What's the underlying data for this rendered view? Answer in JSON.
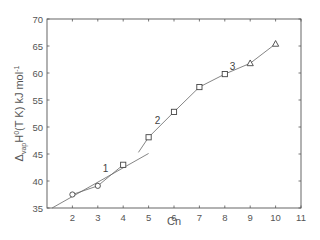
{
  "chart_data": {
    "type": "line",
    "title": "",
    "xlabel": "Cn",
    "ylabel_parts": {
      "delta": "Δ",
      "sub": "vap",
      "H": "H",
      "sup": "0",
      "rest": "(T K) kJ mol",
      "unit_sup": "-1"
    },
    "ylabel": "Δvap H0(T K) kJ mol-1",
    "xlim": [
      1,
      11
    ],
    "ylim": [
      35,
      70
    ],
    "xticks": [
      2,
      3,
      4,
      5,
      6,
      7,
      8,
      9,
      10,
      11
    ],
    "yticks": [
      35,
      40,
      45,
      50,
      55,
      60,
      65,
      70
    ],
    "grid": false,
    "legend": null,
    "series": [
      {
        "name": "group 1",
        "marker": "circle",
        "x": [
          2,
          3
        ],
        "y": [
          37.5,
          39.1
        ]
      },
      {
        "name": "group 2",
        "marker": "square",
        "x": [
          4,
          5,
          6,
          7,
          8
        ],
        "y": [
          43.0,
          48.1,
          52.8,
          57.4,
          59.8
        ]
      },
      {
        "name": "group 3",
        "marker": "triangle",
        "x": [
          9,
          10
        ],
        "y": [
          61.8,
          65.4
        ]
      }
    ],
    "fit_lines": [
      {
        "name": "1",
        "x": [
          1.2,
          5.0
        ],
        "y": [
          35.0,
          45.1
        ]
      },
      {
        "name": "1b",
        "x": [
          2,
          3,
          4
        ],
        "y": [
          37.5,
          39.1,
          43.0
        ]
      },
      {
        "name": "2",
        "x": [
          4.6,
          5,
          6,
          7
        ],
        "y": [
          45.3,
          48.1,
          52.8,
          57.4
        ]
      },
      {
        "name": "3",
        "x": [
          7,
          8,
          9,
          10
        ],
        "y": [
          57.4,
          59.8,
          61.8,
          65.4
        ]
      }
    ],
    "annotations": [
      {
        "text": "1",
        "x": 3.3,
        "y": 41.7
      },
      {
        "text": "2",
        "x": 5.35,
        "y": 50.5
      },
      {
        "text": "3",
        "x": 8.3,
        "y": 60.6
      }
    ]
  }
}
